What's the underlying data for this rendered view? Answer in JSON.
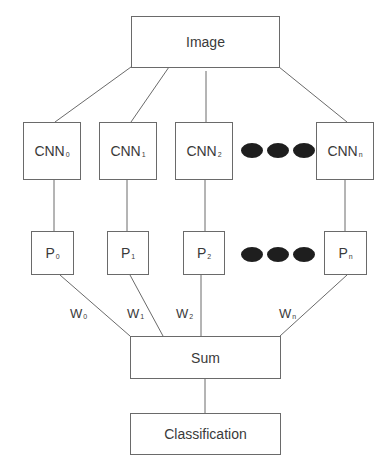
{
  "diagram": {
    "type": "flowchart",
    "input": {
      "label": "Image"
    },
    "cnns": [
      {
        "main": "CNN",
        "sub": "0"
      },
      {
        "main": "CNN",
        "sub": "1"
      },
      {
        "main": "CNN",
        "sub": "2"
      },
      {
        "main": "CNN",
        "sub": "n"
      }
    ],
    "predictions": [
      {
        "main": "P",
        "sub": "0"
      },
      {
        "main": "P",
        "sub": "1"
      },
      {
        "main": "P",
        "sub": "2"
      },
      {
        "main": "P",
        "sub": "n"
      }
    ],
    "weights": [
      {
        "main": "W",
        "sub": "0"
      },
      {
        "main": "W",
        "sub": "1"
      },
      {
        "main": "W",
        "sub": "2"
      },
      {
        "main": "W",
        "sub": "n"
      }
    ],
    "ellipsis": "●●●",
    "sum": {
      "label": "Sum"
    },
    "output": {
      "label": "Classification"
    },
    "edges": [
      [
        "Image",
        "CNN0"
      ],
      [
        "Image",
        "CNN1"
      ],
      [
        "Image",
        "CNN2"
      ],
      [
        "Image",
        "CNNn"
      ],
      [
        "CNN0",
        "P0"
      ],
      [
        "CNN1",
        "P1"
      ],
      [
        "CNN2",
        "P2"
      ],
      [
        "CNNn",
        "Pn"
      ],
      [
        "P0",
        "Sum"
      ],
      [
        "P1",
        "Sum"
      ],
      [
        "P2",
        "Sum"
      ],
      [
        "Pn",
        "Sum"
      ],
      [
        "Sum",
        "Classification"
      ]
    ],
    "colors": {
      "line": "#6a6a6a",
      "dot": "#1e1e1e",
      "text": "#3a3a3a"
    }
  }
}
